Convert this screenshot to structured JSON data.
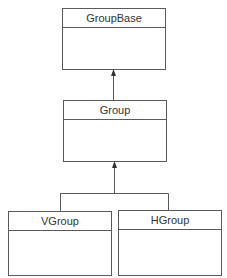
{
  "diagram": {
    "type": "uml-class-hierarchy",
    "classes": [
      {
        "id": "groupbase",
        "name": "GroupBase"
      },
      {
        "id": "group",
        "name": "Group"
      },
      {
        "id": "vgroup",
        "name": "VGroup"
      },
      {
        "id": "hgroup",
        "name": "HGroup"
      }
    ],
    "relationships": [
      {
        "from": "Group",
        "to": "GroupBase",
        "type": "inheritance"
      },
      {
        "from": "VGroup",
        "to": "Group",
        "type": "inheritance"
      },
      {
        "from": "HGroup",
        "to": "Group",
        "type": "inheritance"
      }
    ],
    "colors": {
      "line": "#5a5a5a",
      "text": "#333333",
      "background": "#ffffff"
    }
  }
}
